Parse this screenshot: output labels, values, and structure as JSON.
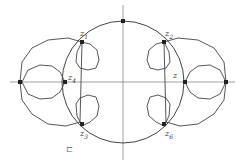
{
  "diagram": {
    "stroke_color": "#444444",
    "axis_color": "#888888",
    "labels": {
      "z1": {
        "base": "z",
        "sub": "1"
      },
      "z2": {
        "base": "z",
        "sub": "2"
      },
      "z3": {
        "base": "z",
        "sub": "3"
      },
      "z4": {
        "base": "z",
        "sub": "4"
      },
      "z_right": {
        "base": "z",
        "sub": ""
      },
      "z6": {
        "base": "z",
        "sub": "6"
      }
    },
    "bottom_mark": "⊏"
  }
}
